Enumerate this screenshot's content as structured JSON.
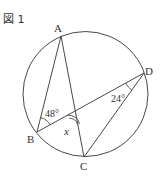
{
  "figure": {
    "title": "図 1",
    "points": {
      "A": {
        "label": "A"
      },
      "B": {
        "label": "B"
      },
      "C": {
        "label": "C"
      },
      "D": {
        "label": "D"
      }
    },
    "angles": {
      "ABD": {
        "label": "48°"
      },
      "ADC": {
        "label": "24°"
      },
      "x": {
        "label": "x"
      }
    },
    "colors": {
      "stroke": "#333333",
      "background": "#ffffff"
    }
  }
}
